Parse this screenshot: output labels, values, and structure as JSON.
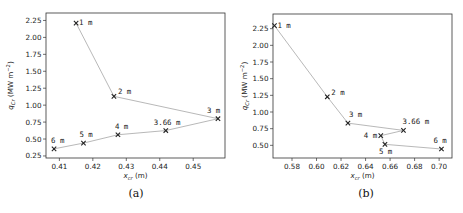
{
  "figure": {
    "captions": [
      "(a)",
      "(b)"
    ]
  },
  "chart_data": [
    {
      "type": "line",
      "panel": "(a)",
      "title": "",
      "xlabel": "x_cr (m)",
      "ylabel": "q_Cr (MW m^-2)",
      "xlim": [
        0.406,
        0.4595
      ],
      "ylim": [
        0.22,
        2.36
      ],
      "xticks": [
        0.41,
        0.42,
        0.43,
        0.44,
        0.45
      ],
      "xtick_labels": [
        "0.41",
        "0.42",
        "0.43",
        "0.44",
        "0.45"
      ],
      "yticks": [
        0.25,
        0.5,
        0.75,
        1.0,
        1.25,
        1.5,
        1.75,
        2.0,
        2.25
      ],
      "ytick_labels": [
        "0.25",
        "0.50",
        "0.75",
        "1.00",
        "1.25",
        "1.50",
        "1.75",
        "2.00",
        "2.25"
      ],
      "grid": false,
      "line_color": "#b0b0b0",
      "marker": "x",
      "points": [
        {
          "label": "1 m",
          "x": 0.415,
          "y": 2.21,
          "label_dx": 3,
          "label_dy": 2
        },
        {
          "label": "2 m",
          "x": 0.4263,
          "y": 1.13,
          "label_dx": 4,
          "label_dy": -2
        },
        {
          "label": "3 m",
          "x": 0.4574,
          "y": 0.8,
          "label_dx": -11,
          "label_dy": -6
        },
        {
          "label": "3.66 m",
          "x": 0.4418,
          "y": 0.625,
          "label_dx": -12,
          "label_dy": -6
        },
        {
          "label": "4 m",
          "x": 0.4275,
          "y": 0.563,
          "label_dx": -3,
          "label_dy": -6
        },
        {
          "label": "5 m",
          "x": 0.4172,
          "y": 0.44,
          "label_dx": -4,
          "label_dy": -6
        },
        {
          "label": "6 m",
          "x": 0.4084,
          "y": 0.355,
          "label_dx": -3,
          "label_dy": -6
        }
      ]
    },
    {
      "type": "line",
      "panel": "(b)",
      "title": "",
      "xlabel": "x_cr (m)",
      "ylabel": "q_Cr (MW m^-2)",
      "xlim": [
        0.5645,
        0.7105
      ],
      "ylim": [
        0.31,
        2.47
      ],
      "xticks": [
        0.58,
        0.6,
        0.62,
        0.64,
        0.66,
        0.68,
        0.7
      ],
      "xtick_labels": [
        "0.58",
        "0.60",
        "0.62",
        "0.64",
        "0.66",
        "0.68",
        "0.70"
      ],
      "yticks": [
        0.5,
        0.75,
        1.0,
        1.25,
        1.5,
        1.75,
        2.0,
        2.25
      ],
      "ytick_labels": [
        "0.50",
        "0.75",
        "1.00",
        "1.25",
        "1.50",
        "1.75",
        "2.00",
        "2.25"
      ],
      "grid": false,
      "line_color": "#b0b0b0",
      "marker": "x",
      "points": [
        {
          "label": "1 m",
          "x": 0.5657,
          "y": 2.295,
          "label_dx": 3,
          "label_dy": 2
        },
        {
          "label": "2 m",
          "x": 0.6088,
          "y": 1.228,
          "label_dx": 4,
          "label_dy": -2
        },
        {
          "label": "3 m",
          "x": 0.6256,
          "y": 0.833,
          "label_dx": 1,
          "label_dy": -6
        },
        {
          "label": "3.66 m",
          "x": 0.6709,
          "y": 0.724,
          "label_dx": -1,
          "label_dy": -6
        },
        {
          "label": "4 m",
          "x": 0.6524,
          "y": 0.645,
          "label_dx": -17,
          "label_dy": 2
        },
        {
          "label": "5 m",
          "x": 0.6558,
          "y": 0.515,
          "label_dx": -6,
          "label_dy": 10
        },
        {
          "label": "6 m",
          "x": 0.7019,
          "y": 0.445,
          "label_dx": -8,
          "label_dy": -6
        }
      ]
    }
  ]
}
